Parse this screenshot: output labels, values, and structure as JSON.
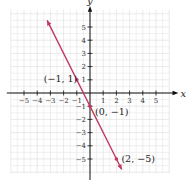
{
  "chart_data": {
    "type": "line",
    "title": "",
    "xlabel": "x",
    "ylabel": "y",
    "xlim": [
      -6,
      6
    ],
    "ylim": [
      -6,
      6
    ],
    "grid": true,
    "x_ticks": [
      -5,
      -4,
      -3,
      -2,
      -1,
      1,
      2,
      3,
      4,
      5
    ],
    "y_ticks": [
      5,
      4,
      3,
      2,
      1,
      -1,
      -2,
      -3,
      -4,
      -5
    ],
    "x_tick_labels": [
      "−5",
      "−4",
      "−3",
      "−2",
      "−1",
      "1",
      "2",
      "3",
      "4",
      "5"
    ],
    "y_tick_labels": [
      "5",
      "4",
      "3",
      "2",
      "1",
      "−1",
      "−2",
      "−3",
      "−4",
      "−5"
    ],
    "series": [
      {
        "name": "y = -2x - 1",
        "color": "#c0375f",
        "x": [
          -3.25,
          2.4
        ],
        "y": [
          5.5,
          -5.8
        ],
        "arrows": "both"
      }
    ],
    "points": [
      {
        "x": -1,
        "y": 1,
        "label": "(−1, 1)"
      },
      {
        "x": 0,
        "y": -1,
        "label": "(0, −1)"
      },
      {
        "x": 2,
        "y": -5,
        "label": "(2, −5)"
      }
    ]
  },
  "colors": {
    "line": "#c0375f",
    "grid": "#dcdcdc",
    "axis": "#111111"
  }
}
